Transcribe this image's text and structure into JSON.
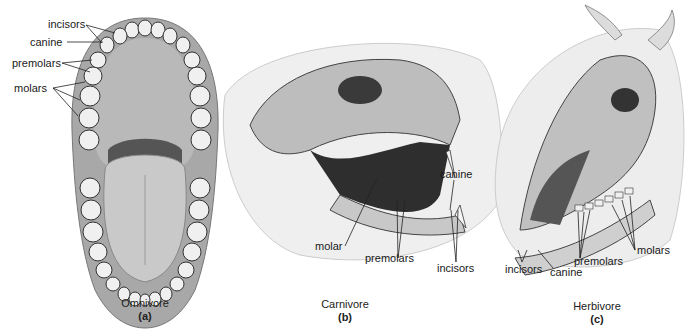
{
  "panels": [
    {
      "id": "a",
      "caption": "Omnivore",
      "letter": "(a)",
      "labels": [
        "incisors",
        "canine",
        "premolars",
        "molars"
      ]
    },
    {
      "id": "b",
      "caption": "Carnivore",
      "letter": "(b)",
      "labels": [
        "canine",
        "molar",
        "premolars",
        "incisors"
      ]
    },
    {
      "id": "c",
      "caption": "Herbivore",
      "letter": "(c)",
      "labels": [
        "molars",
        "premolars",
        "incisors",
        "canine"
      ]
    }
  ],
  "colors": {
    "bone": "#d8d8d8",
    "shade": "#9a9a9a",
    "dark": "#3a3a3a",
    "gum": "#b8b8b8",
    "tooth": "#f2f2f2",
    "fur": "#e6e6e6"
  }
}
